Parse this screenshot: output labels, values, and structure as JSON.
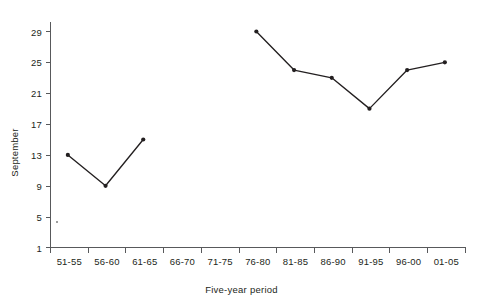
{
  "chart_data": {
    "type": "line",
    "title": "",
    "subtitle": "",
    "xlabel": "Five-year period",
    "ylabel": "September",
    "categories": [
      "51-55",
      "56-60",
      "61-65",
      "66-70",
      "71-75",
      "76-80",
      "81-85",
      "86-90",
      "91-95",
      "96-00",
      "01-05"
    ],
    "values": [
      13,
      9,
      15,
      null,
      null,
      29,
      24,
      23,
      19,
      24,
      25
    ],
    "series": [
      {
        "name": "September",
        "values": [
          13,
          9,
          15,
          null,
          null,
          29,
          24,
          23,
          19,
          24,
          25
        ]
      }
    ],
    "ylim": [
      1,
      31
    ],
    "yticks": [
      1,
      5,
      9,
      13,
      17,
      21,
      25,
      29
    ],
    "ytick_labels": [
      "1",
      "5",
      "9",
      "13",
      "17",
      "21",
      "25",
      "29"
    ],
    "xtick_labels": [
      "51-55",
      "56-60",
      "61-65",
      "66-70",
      "71-75",
      "76-80",
      "81-85",
      "86-90",
      "91-95",
      "96-00",
      "01-05"
    ],
    "grid": false,
    "legend": false,
    "legend_position": "none",
    "marker": "filled-circle",
    "line_color": "#231f20",
    "marker_color": "#231f20",
    "axis_color": "#58595b",
    "background_color": "#ffffff"
  },
  "axes": {
    "y_title": "September",
    "x_title": "Five-year period"
  }
}
